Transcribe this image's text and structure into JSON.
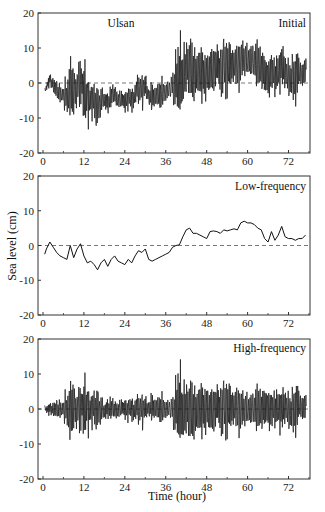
{
  "figure": {
    "ylabel": "Sea level (cm)",
    "xlabel": "Time (hour)",
    "station": "Ulsan"
  },
  "chart_data": [
    {
      "type": "line",
      "title": "Initial",
      "annotation": "Ulsan",
      "xlabel": "",
      "ylabel": "",
      "xlim": [
        0,
        78.3
      ],
      "ylim": [
        -20,
        20
      ],
      "xticks": [
        0,
        12,
        24,
        36,
        48,
        60,
        72
      ],
      "yticks": [
        -20,
        -10,
        0,
        10,
        20
      ],
      "ytick_labels": [
        "-20",
        "-10",
        "0",
        "10",
        "20"
      ],
      "zero_line": "dashed",
      "grid": false,
      "composition": "low_frequency + high_frequency",
      "description": "Observed (initial) sea level residual; noisy record with negative bias until ~39 h then positive bias with spikes up to ~16 cm and down to ~-17 cm at ~39.5 h"
    },
    {
      "type": "line",
      "title": "Low-frequency",
      "xlabel": "",
      "ylabel": "Sea level (cm)",
      "xlim": [
        0,
        78.3
      ],
      "ylim": [
        -20,
        20
      ],
      "xticks": [
        0,
        12,
        24,
        36,
        48,
        60,
        72
      ],
      "yticks": [
        -20,
        -10,
        0,
        10,
        20
      ],
      "ytick_labels": [
        "-20",
        "-10",
        "0",
        "10",
        "20"
      ],
      "zero_line": "dashed",
      "grid": false,
      "x": [
        0.5,
        1,
        2,
        3,
        4,
        5,
        6,
        7,
        8,
        9,
        10,
        11,
        12,
        13,
        14,
        15,
        16,
        17,
        18,
        19,
        20,
        21,
        22,
        23,
        24,
        25,
        26,
        27,
        28,
        29,
        30,
        31,
        32,
        33,
        34,
        35,
        36,
        37,
        38,
        39,
        40,
        41,
        42,
        43,
        44,
        45,
        46,
        47,
        48,
        49,
        50,
        51,
        52,
        53,
        54,
        55,
        56,
        57,
        58,
        59,
        60,
        61,
        62,
        63,
        64,
        65,
        66,
        67,
        68,
        69,
        70,
        71,
        72,
        73,
        74,
        75,
        76,
        77
      ],
      "values": [
        -2.5,
        -1,
        1,
        -0.5,
        -2,
        -3,
        -3.5,
        -4,
        0,
        -3.5,
        -1,
        0.5,
        -3,
        -5,
        -4.5,
        -5.5,
        -7,
        -5,
        -4,
        -6,
        -4,
        -3,
        -4.5,
        -5,
        -5.5,
        -4,
        -5,
        -3,
        -1.5,
        -2,
        -1,
        -4,
        -4.5,
        -4,
        -3.5,
        -3,
        -2.5,
        -2,
        -0.5,
        0,
        0.2,
        2.5,
        4.5,
        5,
        3.5,
        3.5,
        3,
        2.5,
        2,
        4,
        4.2,
        4,
        3.5,
        4.5,
        4.2,
        4.5,
        4.8,
        4.5,
        6.5,
        7,
        6.5,
        6.5,
        6,
        5,
        4.5,
        2,
        1,
        4,
        1.5,
        3,
        5.5,
        2.5,
        2,
        2,
        1.5,
        2,
        2,
        3
      ]
    },
    {
      "type": "line",
      "title": "High-frequency",
      "xlabel": "Time (hour)",
      "ylabel": "",
      "xlim": [
        0,
        78.3
      ],
      "ylim": [
        -20,
        20
      ],
      "xticks": [
        0,
        12,
        24,
        36,
        48,
        60,
        72
      ],
      "yticks": [
        -20,
        -10,
        0,
        10,
        20
      ],
      "ytick_labels": [
        "-20",
        "-10",
        "0",
        "10",
        "20"
      ],
      "zero_line": "dashed",
      "grid": false,
      "envelope_hours": [
        0,
        1,
        2,
        3,
        4,
        5,
        6,
        7,
        8,
        9,
        10,
        11,
        12,
        13,
        14,
        15,
        16,
        17,
        18,
        19,
        20,
        21,
        22,
        23,
        24,
        25,
        26,
        27,
        28,
        29,
        30,
        31,
        32,
        33,
        34,
        35,
        36,
        37,
        38,
        39,
        40,
        41,
        42,
        43,
        44,
        45,
        46,
        47,
        48,
        49,
        50,
        51,
        52,
        53,
        54,
        55,
        56,
        57,
        58,
        59,
        60,
        61,
        62,
        63,
        64,
        65,
        66,
        67,
        68,
        69,
        70,
        71,
        72,
        73,
        74,
        75,
        76,
        77
      ],
      "envelope_amplitude": [
        1,
        1.5,
        2.5,
        3,
        4,
        3.5,
        3.5,
        8,
        12,
        9,
        8,
        10,
        11,
        9,
        7,
        9,
        8,
        5,
        4,
        4,
        5,
        4,
        4,
        3.5,
        4.5,
        4,
        5,
        4,
        6,
        7,
        5,
        4,
        8,
        5,
        6,
        5,
        4,
        4,
        5,
        15,
        16,
        12,
        11,
        13,
        12,
        14,
        13,
        11,
        10,
        9,
        10,
        9,
        9,
        12,
        13,
        8,
        8,
        9,
        8,
        7,
        8,
        8,
        8,
        10,
        11,
        8,
        9,
        7,
        8,
        8,
        9,
        7,
        7,
        8,
        14,
        8,
        6,
        5
      ],
      "peak_max": 15.5,
      "peak_min": -16,
      "description": "Zero-mean high-frequency oscillations; quiet first ~7 h, energetic bursts at 7-17 h and 39-55 h"
    }
  ]
}
